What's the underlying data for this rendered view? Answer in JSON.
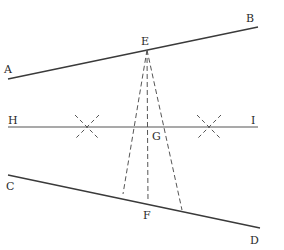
{
  "diagram": {
    "type": "geometric-construction",
    "lines": [
      {
        "id": "AB",
        "from": [
          8,
          79
        ],
        "to": [
          258,
          27
        ],
        "style": "solid"
      },
      {
        "id": "HI",
        "from": [
          8,
          127
        ],
        "to": [
          258,
          127
        ],
        "style": "solid"
      },
      {
        "id": "CD",
        "from": [
          8,
          175
        ],
        "to": [
          260,
          228
        ],
        "style": "solid"
      }
    ],
    "dashed_lines": [
      {
        "id": "EF",
        "from": [
          147,
          50
        ],
        "to": [
          148,
          202
        ]
      },
      {
        "id": "E-left",
        "from": [
          147,
          50
        ],
        "to": [
          123,
          194
        ]
      },
      {
        "id": "E-right",
        "from": [
          147,
          50
        ],
        "to": [
          182,
          210
        ]
      }
    ],
    "crosses": [
      {
        "id": "cross-left",
        "center": [
          87,
          127
        ]
      },
      {
        "id": "cross-right",
        "center": [
          209,
          127
        ]
      }
    ],
    "labels": {
      "A": "A",
      "B": "B",
      "C": "C",
      "D": "D",
      "E": "E",
      "F": "F",
      "G": "G",
      "H": "H",
      "I": "I"
    }
  }
}
